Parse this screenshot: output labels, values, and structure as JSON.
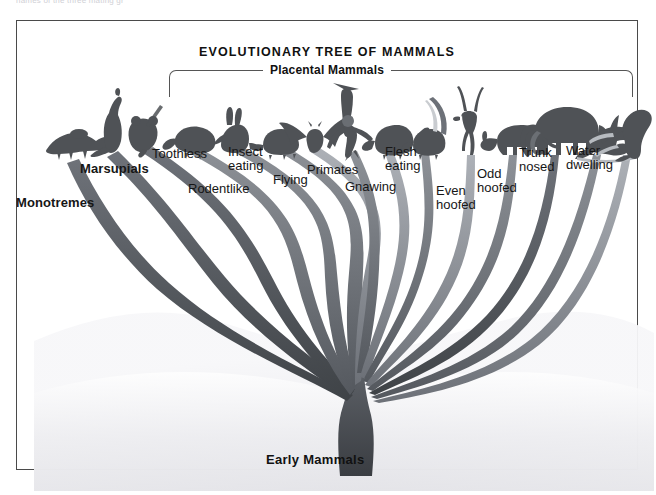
{
  "page": {
    "cut_caption": "names of the three mating gr",
    "figure_title": "EVOLUTIONARY TREE OF MAMMALS",
    "bracket_label": "Placental Mammals",
    "root_label": "Early Mammals"
  },
  "chart_data": {
    "type": "diagram",
    "title": "EVOLUTIONARY TREE OF MAMMALS",
    "subtitle": "Placental Mammals",
    "root": "Early Mammals",
    "grouping": {
      "non_placental": [
        "Monotremes",
        "Marsupials"
      ],
      "placental": [
        "Toothless",
        "Rodentlike",
        "Insect eating",
        "Flying",
        "Primates",
        "Gnawing",
        "Flesh eating",
        "Even hoofed",
        "Odd hoofed",
        "Trunk nosed",
        "Water dwelling"
      ]
    },
    "branches": [
      {
        "label": "Monotremes",
        "bold": true,
        "lines": [
          "Monotremes"
        ],
        "label_x": 16,
        "label_y": 196,
        "tip_x": 46,
        "tip_y": 140,
        "animal": "platypus"
      },
      {
        "label": "Marsupials",
        "bold": true,
        "lines": [
          "Marsupials"
        ],
        "label_x": 80,
        "label_y": 162,
        "tip_x": 88,
        "tip_y": 132,
        "animal": "kangaroo"
      },
      {
        "label": "",
        "bold": false,
        "lines": [],
        "label_x": 0,
        "label_y": 0,
        "tip_x": 124,
        "tip_y": 132,
        "animal": "koala"
      },
      {
        "label": "Toothless",
        "bold": false,
        "lines": [
          "Toothless"
        ],
        "label_x": 152,
        "label_y": 147,
        "tip_x": 170,
        "tip_y": 132,
        "animal": "anteater"
      },
      {
        "label": "Rodentlike",
        "bold": false,
        "lines": [
          "Rodentlike"
        ],
        "label_x": 188,
        "label_y": 182,
        "tip_x": 213,
        "tip_y": 132,
        "animal": "rabbit"
      },
      {
        "label": "Insect eating",
        "bold": false,
        "lines": [
          "Insect",
          "eating"
        ],
        "label_x": 228,
        "label_y": 145,
        "tip_x": 258,
        "tip_y": 132,
        "animal": "hedgehog"
      },
      {
        "label": "Flying",
        "bold": false,
        "lines": [
          "Flying"
        ],
        "label_x": 273,
        "label_y": 173,
        "tip_x": 292,
        "tip_y": 132,
        "animal": "bat"
      },
      {
        "label": "Primates",
        "bold": false,
        "lines": [
          "Primates"
        ],
        "label_x": 307,
        "label_y": 163,
        "tip_x": 333,
        "tip_y": 132,
        "animal": "primate"
      },
      {
        "label": "Gnawing",
        "bold": false,
        "lines": [
          "Gnawing"
        ],
        "label_x": 345,
        "label_y": 180,
        "tip_x": 371,
        "tip_y": 132,
        "animal": "beaver"
      },
      {
        "label": "Flesh eating",
        "bold": false,
        "lines": [
          "Flesh",
          "eating"
        ],
        "label_x": 385,
        "label_y": 145,
        "tip_x": 407,
        "tip_y": 132,
        "animal": "skunk"
      },
      {
        "label": "Even hoofed",
        "bold": false,
        "lines": [
          "Even",
          "hoofed"
        ],
        "label_x": 436,
        "label_y": 184,
        "tip_x": 452,
        "tip_y": 132,
        "animal": "antelope"
      },
      {
        "label": "Odd hoofed",
        "bold": false,
        "lines": [
          "Odd",
          "hoofed"
        ],
        "label_x": 477,
        "label_y": 167,
        "tip_x": 493,
        "tip_y": 132,
        "animal": "rhino"
      },
      {
        "label": "Trunk nosed",
        "bold": false,
        "lines": [
          "Trunk",
          "nosed"
        ],
        "label_x": 519,
        "label_y": 146,
        "tip_x": 536,
        "tip_y": 132,
        "animal": "elephant"
      },
      {
        "label": "Water dwelling",
        "bold": false,
        "lines": [
          "Water",
          "dwelling"
        ],
        "label_x": 566,
        "label_y": 144,
        "tip_x": 580,
        "tip_y": 132,
        "animal": "dolphin"
      },
      {
        "label": "",
        "bold": false,
        "lines": [],
        "label_x": 0,
        "label_y": 0,
        "tip_x": 610,
        "tip_y": 132,
        "animal": "manatee"
      }
    ]
  },
  "colors": {
    "frame": "#4a4a4a",
    "bracket": "#555555",
    "text": "#161616",
    "branch_dark": "#585b60",
    "branch_mid": "#7b7f85",
    "branch_light": "#a7abb1",
    "trunk": "#4c5055",
    "ground": "#ededf0",
    "background": "#ffffff"
  }
}
